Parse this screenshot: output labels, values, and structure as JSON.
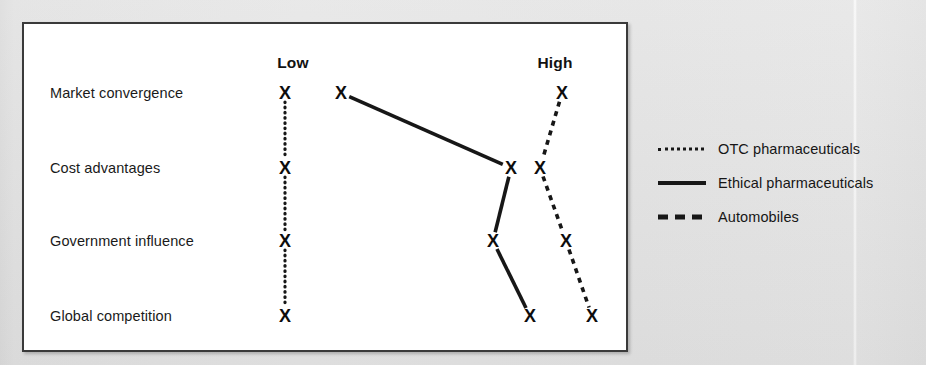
{
  "chart_data": {
    "type": "scatter",
    "title": "",
    "xlabel": "",
    "ylabel": "",
    "axis_labels": [
      "Low",
      "High"
    ],
    "axis_label_x": [
      293,
      555
    ],
    "grid": false,
    "legend_position": "right",
    "categories": [
      "Market convergence",
      "Cost advantages",
      "Government influence",
      "Global competition"
    ],
    "category_y": [
      93,
      168,
      241,
      316
    ],
    "x_range_low": 285,
    "x_range_high": 600,
    "series": [
      {
        "name": "OTC pharmaceuticals",
        "style": "dotted",
        "color": "#171717",
        "values": [
          "Low",
          "Low",
          "Low",
          "Low"
        ],
        "points_x": [
          285,
          285,
          285,
          285
        ]
      },
      {
        "name": "Ethical pharmaceuticals",
        "style": "solid",
        "color": "#171717",
        "values": [
          "Low",
          "High",
          "Medium-High",
          "High"
        ],
        "points_x": [
          341,
          511,
          493,
          530
        ]
      },
      {
        "name": "Automobiles",
        "style": "dashed",
        "color": "#171717",
        "values": [
          "High",
          "High",
          "High",
          "High"
        ],
        "points_x": [
          562,
          540,
          566,
          592
        ]
      }
    ],
    "marker_glyph": "X"
  },
  "chart": {
    "headers": [
      {
        "label": "Low"
      },
      {
        "label": "High"
      }
    ],
    "rows": [
      {
        "label": "Market convergence"
      },
      {
        "label": "Cost advantages"
      },
      {
        "label": "Government influence"
      },
      {
        "label": "Global competition"
      }
    ],
    "marker": "X"
  },
  "legend": {
    "items": [
      {
        "label": "OTC pharmaceuticals",
        "style": "dotted"
      },
      {
        "label": "Ethical pharmaceuticals",
        "style": "solid"
      },
      {
        "label": "Automobiles",
        "style": "dashed"
      }
    ]
  },
  "colors": {
    "ink": "#171717",
    "frame": "#3a3a3a",
    "plot_background": "#ffffff",
    "page_background": "#e4e4e4"
  }
}
